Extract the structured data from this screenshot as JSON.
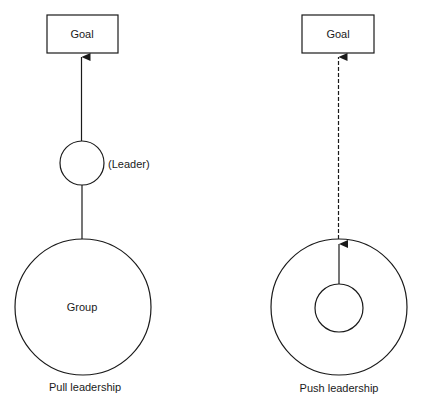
{
  "diagram": {
    "line_color": "#1a1a1a",
    "pull": {
      "goal_label": "Goal",
      "leader_label": "(Leader)",
      "group_label": "Group",
      "caption": "Pull leadership"
    },
    "push": {
      "goal_label": "Goal",
      "caption": "Push leadership"
    }
  }
}
